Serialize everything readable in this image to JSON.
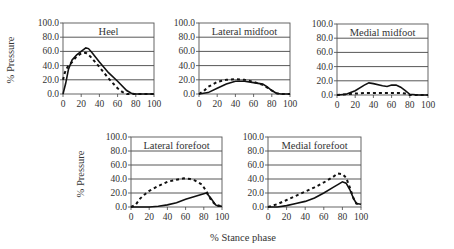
{
  "chart_data": [
    {
      "type": "line",
      "title": "Heel",
      "xlabel": "",
      "ylabel": "% Pressure",
      "xlim": [
        0,
        100
      ],
      "ylim": [
        0,
        100
      ],
      "x_ticks": [
        "0",
        "20",
        "40",
        "60",
        "80",
        "100"
      ],
      "y_ticks": [
        "0.0",
        "20.0",
        "40.0",
        "60.0",
        "80.0",
        "100.0"
      ],
      "grid": true,
      "series": [
        {
          "name": "solid",
          "style": "solid",
          "x": [
            0,
            3,
            6,
            10,
            15,
            20,
            25,
            28,
            32,
            40,
            50,
            60,
            70,
            75,
            80,
            90,
            100
          ],
          "y": [
            0,
            15,
            35,
            48,
            55,
            60,
            65,
            64,
            58,
            45,
            30,
            18,
            5,
            1,
            0,
            0,
            0
          ]
        },
        {
          "name": "dashed",
          "style": "dashed",
          "x": [
            0,
            2,
            5,
            10,
            15,
            20,
            25,
            30,
            40,
            50,
            60,
            65,
            70,
            80,
            100
          ],
          "y": [
            20,
            30,
            38,
            45,
            53,
            57,
            58,
            53,
            38,
            22,
            8,
            3,
            0,
            0,
            0
          ]
        }
      ]
    },
    {
      "type": "line",
      "title": "Lateral midfoot",
      "xlim": [
        0,
        100
      ],
      "ylim": [
        0,
        100
      ],
      "x_ticks": [
        "0",
        "20",
        "40",
        "60",
        "80",
        "100"
      ],
      "y_ticks": [
        "0.0",
        "20.0",
        "40.0",
        "60.0",
        "80.0",
        "100.0"
      ],
      "grid": true,
      "series": [
        {
          "name": "solid",
          "style": "solid",
          "x": [
            0,
            10,
            20,
            30,
            40,
            50,
            60,
            70,
            75,
            80,
            85,
            90,
            100
          ],
          "y": [
            0,
            2,
            8,
            14,
            18,
            18,
            16,
            14,
            10,
            5,
            1,
            0,
            0
          ]
        },
        {
          "name": "dashed",
          "style": "dashed",
          "x": [
            0,
            5,
            10,
            20,
            30,
            40,
            50,
            60,
            70,
            80,
            85,
            90,
            100
          ],
          "y": [
            0,
            4,
            10,
            17,
            20,
            21,
            20,
            17,
            13,
            5,
            1,
            0,
            0
          ]
        }
      ]
    },
    {
      "type": "line",
      "title": "Medial midfoot",
      "xlim": [
        0,
        100
      ],
      "ylim": [
        0,
        100
      ],
      "x_ticks": [
        "0",
        "20",
        "40",
        "60",
        "80",
        "100"
      ],
      "y_ticks": [
        "0.0",
        "20.0",
        "40.0",
        "60.0",
        "80.0",
        "100.0"
      ],
      "grid": true,
      "series": [
        {
          "name": "solid",
          "style": "solid",
          "x": [
            0,
            10,
            20,
            30,
            35,
            40,
            50,
            55,
            60,
            65,
            70,
            75,
            80,
            90,
            100
          ],
          "y": [
            0,
            1,
            6,
            14,
            17,
            16,
            13,
            12,
            14,
            14,
            11,
            6,
            1,
            0,
            0
          ]
        },
        {
          "name": "dashed",
          "style": "dashed",
          "x": [
            0,
            10,
            20,
            30,
            40,
            50,
            60,
            70,
            75,
            80,
            100
          ],
          "y": [
            0,
            1,
            2,
            3,
            3,
            3,
            3,
            3,
            2,
            0,
            0
          ]
        }
      ]
    },
    {
      "type": "line",
      "title": "Lateral forefoot",
      "xlabel": "% Stance phase",
      "ylabel": "% Pressure",
      "xlim": [
        0,
        100
      ],
      "ylim": [
        0,
        100
      ],
      "x_ticks": [
        "0",
        "20",
        "40",
        "60",
        "80",
        "100"
      ],
      "y_ticks": [
        "0.0",
        "20.0",
        "40.0",
        "60.0",
        "80.0",
        "100.0"
      ],
      "grid": true,
      "series": [
        {
          "name": "solid",
          "style": "solid",
          "x": [
            0,
            10,
            20,
            30,
            40,
            50,
            60,
            70,
            80,
            83,
            88,
            93,
            96,
            100
          ],
          "y": [
            0,
            0,
            0,
            1,
            3,
            6,
            11,
            15,
            19,
            20,
            12,
            3,
            1,
            1
          ]
        },
        {
          "name": "dashed",
          "style": "dashed",
          "x": [
            0,
            5,
            10,
            15,
            20,
            30,
            40,
            50,
            58,
            65,
            70,
            78,
            83,
            88,
            93,
            100
          ],
          "y": [
            0,
            3,
            12,
            18,
            23,
            30,
            36,
            39,
            41,
            40,
            38,
            32,
            22,
            10,
            3,
            1
          ]
        }
      ]
    },
    {
      "type": "line",
      "title": "Medial forefoot",
      "xlabel": "% Stance phase",
      "xlim": [
        0,
        100
      ],
      "ylim": [
        0,
        100
      ],
      "x_ticks": [
        "0",
        "20",
        "40",
        "60",
        "80",
        "100"
      ],
      "y_ticks": [
        "0.0",
        "20.0",
        "40.0",
        "60.0",
        "80.0",
        "100.0"
      ],
      "grid": true,
      "series": [
        {
          "name": "solid",
          "style": "solid",
          "x": [
            0,
            10,
            20,
            30,
            40,
            50,
            60,
            70,
            75,
            80,
            84,
            88,
            92,
            95,
            100
          ],
          "y": [
            0,
            0,
            2,
            5,
            8,
            13,
            20,
            28,
            32,
            36,
            34,
            25,
            12,
            5,
            4
          ]
        },
        {
          "name": "dashed",
          "style": "dashed",
          "x": [
            0,
            10,
            20,
            30,
            40,
            50,
            60,
            70,
            75,
            80,
            84,
            88,
            92,
            95,
            100
          ],
          "y": [
            0,
            4,
            10,
            16,
            22,
            28,
            35,
            43,
            48,
            47,
            42,
            28,
            12,
            5,
            4
          ]
        }
      ]
    }
  ],
  "labels": {
    "ylabel_top": "% Pressure",
    "ylabel_bottom": "% Pressure",
    "xlabel": "% Stance phase"
  }
}
